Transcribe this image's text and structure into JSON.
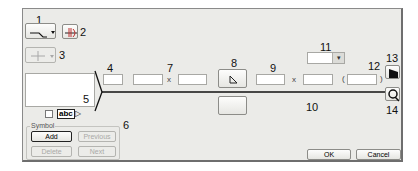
{
  "callouts": {
    "c1": "1",
    "c2": "2",
    "c3": "3",
    "c4": "4",
    "c5": "5",
    "c6": "6",
    "c7": "7",
    "c8": "8",
    "c9": "9",
    "c10": "10",
    "c11": "11",
    "c12": "12",
    "c13": "13",
    "c14": "14"
  },
  "toolbar": {
    "leader_style_icon": "leader-line-icon",
    "weld_symbol_icon": "weld-symbol-icon",
    "grid_icon": "crosshair-icon"
  },
  "fields": {
    "field4": "",
    "field7a": "",
    "field7b": "",
    "field9": "",
    "field10": "",
    "field12": "",
    "dropdown11": ""
  },
  "separators": {
    "times1": "x",
    "times2": "x",
    "open_paren": "(",
    "close_paren": ")"
  },
  "tail": {
    "abc_label": "abc"
  },
  "symbol_group": {
    "legend": "Symbol",
    "add": "Add",
    "previous": "Previous",
    "delete": "Delete",
    "next": "Next"
  },
  "footer": {
    "ok": "OK",
    "cancel": "Cancel"
  }
}
